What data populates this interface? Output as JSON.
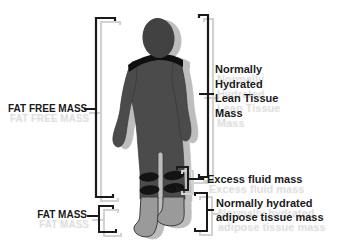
{
  "canvas": {
    "width": 337,
    "height": 247,
    "background": "#ffffff"
  },
  "figure": {
    "colors": {
      "body": "#4b4b4b",
      "head": "#424242",
      "band": "#0f0f0f",
      "lower_leg": "#9a9a9a",
      "outline": "#333333",
      "shadow": "#bdbdbd",
      "bracket": "#1a1a1a",
      "bracket_ghost": "#d2d2d2",
      "label_text": "#1a1a1a",
      "label_ghost": "#dadada"
    }
  },
  "labels": {
    "fat_free_mass": "FAT FREE MASS",
    "fat_mass": "FAT MASS",
    "lean_tissue_lines": [
      "Normally",
      "Hydrated",
      "Lean Tissue",
      "Mass"
    ],
    "excess_fluid": "Excess fluid mass",
    "adipose_lines": [
      "Normally hydrated",
      "adipose tissue mass"
    ]
  }
}
